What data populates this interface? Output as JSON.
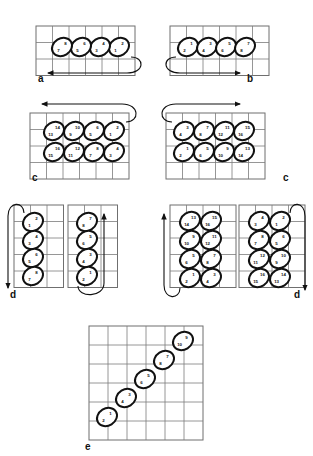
{
  "figure": {
    "panels": [
      {
        "id": "a",
        "label": "a",
        "label_x": 38,
        "label_y": 82,
        "grid": {
          "x": 36,
          "y": 26,
          "cols": 6,
          "rows": 3,
          "cell": 16.5
        },
        "direction": "right-to-left",
        "cells": [
          {
            "cx": 119,
            "cy": 47,
            "top": "2",
            "bottom": "1"
          },
          {
            "cx": 100,
            "cy": 47,
            "top": "4",
            "bottom": "3"
          },
          {
            "cx": 81,
            "cy": 47,
            "top": "6",
            "bottom": "5"
          },
          {
            "cx": 62,
            "cy": 47,
            "top": "8",
            "bottom": "7"
          }
        ],
        "arrow": {
          "type": "u-turn-left",
          "x1": 131,
          "y1": 57,
          "x2": 48,
          "y2": 73
        }
      },
      {
        "id": "b",
        "label": "b",
        "label_x": 247,
        "label_y": 82,
        "grid": {
          "x": 170,
          "y": 26,
          "cols": 6,
          "rows": 3,
          "cell": 16.5
        },
        "direction": "left-to-right",
        "cells": [
          {
            "cx": 188,
            "cy": 47,
            "top": "1",
            "bottom": "2"
          },
          {
            "cx": 207,
            "cy": 47,
            "top": "3",
            "bottom": "4"
          },
          {
            "cx": 226,
            "cy": 47,
            "top": "5",
            "bottom": "6"
          },
          {
            "cx": 245,
            "cy": 47,
            "top": "7",
            "bottom": "8"
          }
        ],
        "arrow": {
          "type": "u-turn-right",
          "x1": 176,
          "y1": 57,
          "x2": 240,
          "y2": 73
        }
      },
      {
        "id": "c-left",
        "label": "c",
        "label_x": 32,
        "label_y": 181,
        "grid": {
          "x": 30,
          "y": 113,
          "cols": 6,
          "rows": 4,
          "cell": 16.5
        },
        "direction": "right-to-left-boustrophedon",
        "cells": [
          {
            "cx": 114,
            "cy": 131,
            "top": "2",
            "bottom": "1"
          },
          {
            "cx": 94,
            "cy": 131,
            "top": "6",
            "bottom": "5"
          },
          {
            "cx": 74,
            "cy": 131,
            "top": "10",
            "bottom": "9"
          },
          {
            "cx": 54,
            "cy": 131,
            "top": "14",
            "bottom": "13"
          },
          {
            "cx": 114,
            "cy": 152,
            "top": "4",
            "bottom": "3"
          },
          {
            "cx": 94,
            "cy": 152,
            "top": "8",
            "bottom": "7"
          },
          {
            "cx": 74,
            "cy": 152,
            "top": "12",
            "bottom": "11"
          },
          {
            "cx": 54,
            "cy": 152,
            "top": "16",
            "bottom": "15"
          }
        ],
        "arrow": {
          "type": "u-turn-left",
          "x1": 126,
          "y1": 122,
          "x2": 42,
          "y2": 104
        }
      },
      {
        "id": "c-right",
        "label": "c",
        "label_x": 283,
        "label_y": 181,
        "grid": {
          "x": 166,
          "y": 113,
          "cols": 6,
          "rows": 4,
          "cell": 16.5
        },
        "direction": "left-to-right-boustrophedon",
        "cells": [
          {
            "cx": 184,
            "cy": 131,
            "top": "3",
            "bottom": "4"
          },
          {
            "cx": 204,
            "cy": 131,
            "top": "7",
            "bottom": "8"
          },
          {
            "cx": 224,
            "cy": 131,
            "top": "11",
            "bottom": "12"
          },
          {
            "cx": 244,
            "cy": 131,
            "top": "15",
            "bottom": "16"
          },
          {
            "cx": 184,
            "cy": 152,
            "top": "1",
            "bottom": "2"
          },
          {
            "cx": 204,
            "cy": 152,
            "top": "5",
            "bottom": "6"
          },
          {
            "cx": 224,
            "cy": 152,
            "top": "9",
            "bottom": "10"
          },
          {
            "cx": 244,
            "cy": 152,
            "top": "13",
            "bottom": "14"
          }
        ],
        "arrow": {
          "type": "u-turn-right",
          "x1": 172,
          "y1": 122,
          "x2": 240,
          "y2": 104
        }
      },
      {
        "id": "d-1",
        "label": "d",
        "label_x": 10,
        "label_y": 298,
        "grid": {
          "x": 14,
          "y": 205,
          "cols": 3,
          "rows": 5,
          "cell": 16.5
        },
        "direction": "top-to-bottom",
        "cells": [
          {
            "cx": 33,
            "cy": 222,
            "top": "2",
            "bottom": "1"
          },
          {
            "cx": 33,
            "cy": 240,
            "top": "4",
            "bottom": "3"
          },
          {
            "cx": 33,
            "cy": 258,
            "top": "6",
            "bottom": "5"
          },
          {
            "cx": 33,
            "cy": 276,
            "top": "8",
            "bottom": "7"
          }
        ],
        "arrow": {
          "type": "u-turn-down",
          "x1": 24,
          "y1": 213,
          "x2": 8,
          "y2": 288
        }
      },
      {
        "id": "d-2",
        "label": "",
        "label_x": 0,
        "label_y": 0,
        "grid": {
          "x": 68,
          "y": 205,
          "cols": 3,
          "rows": 5,
          "cell": 16.5
        },
        "direction": "bottom-to-top",
        "cells": [
          {
            "cx": 87,
            "cy": 222,
            "top": "7",
            "bottom": "8"
          },
          {
            "cx": 87,
            "cy": 240,
            "top": "5",
            "bottom": "6"
          },
          {
            "cx": 87,
            "cy": 258,
            "top": "3",
            "bottom": "4"
          },
          {
            "cx": 87,
            "cy": 276,
            "top": "1",
            "bottom": "2"
          }
        ],
        "arrow": {
          "type": "u-turn-up",
          "x1": 78,
          "y1": 286,
          "x2": 104,
          "y2": 214
        }
      },
      {
        "id": "d-3",
        "label": "",
        "label_x": 0,
        "label_y": 0,
        "grid": {
          "x": 170,
          "y": 205,
          "cols": 4,
          "rows": 5,
          "cell": 16.5
        },
        "direction": "bottom-to-top-boustrophedon",
        "cells": [
          {
            "cx": 190,
            "cy": 221,
            "top": "13",
            "bottom": "14"
          },
          {
            "cx": 211,
            "cy": 221,
            "top": "15",
            "bottom": "16"
          },
          {
            "cx": 190,
            "cy": 240,
            "top": "9",
            "bottom": "10"
          },
          {
            "cx": 211,
            "cy": 240,
            "top": "11",
            "bottom": "12"
          },
          {
            "cx": 190,
            "cy": 259,
            "top": "5",
            "bottom": "6"
          },
          {
            "cx": 211,
            "cy": 259,
            "top": "7",
            "bottom": "8"
          },
          {
            "cx": 190,
            "cy": 278,
            "top": "1",
            "bottom": "2"
          },
          {
            "cx": 211,
            "cy": 278,
            "top": "3",
            "bottom": "4"
          }
        ],
        "arrow": {
          "type": "u-turn-up",
          "x1": 180,
          "y1": 288,
          "x2": 164,
          "y2": 214
        }
      },
      {
        "id": "d-4",
        "label": "d",
        "label_x": 294,
        "label_y": 298,
        "grid": {
          "x": 239,
          "y": 205,
          "cols": 4,
          "rows": 5,
          "cell": 16.5
        },
        "direction": "top-to-bottom-boustrophedon",
        "cells": [
          {
            "cx": 259,
            "cy": 221,
            "top": "4",
            "bottom": "3"
          },
          {
            "cx": 280,
            "cy": 221,
            "top": "2",
            "bottom": "1"
          },
          {
            "cx": 259,
            "cy": 240,
            "top": "8",
            "bottom": "7"
          },
          {
            "cx": 280,
            "cy": 240,
            "top": "6",
            "bottom": "5"
          },
          {
            "cx": 259,
            "cy": 259,
            "top": "12",
            "bottom": "11"
          },
          {
            "cx": 280,
            "cy": 259,
            "top": "10",
            "bottom": "9"
          },
          {
            "cx": 259,
            "cy": 278,
            "top": "16",
            "bottom": "15"
          },
          {
            "cx": 280,
            "cy": 278,
            "top": "14",
            "bottom": "13"
          }
        ],
        "arrow": {
          "type": "u-turn-down",
          "x1": 290,
          "y1": 213,
          "x2": 305,
          "y2": 290
        }
      },
      {
        "id": "e",
        "label": "e",
        "label_x": 85,
        "label_y": 450,
        "grid": {
          "x": 89,
          "y": 326,
          "cols": 6,
          "rows": 6,
          "cell": 19
        },
        "direction": "diagonal",
        "cells": [
          {
            "cx": 107,
            "cy": 417,
            "top": "1",
            "bottom": "2"
          },
          {
            "cx": 126,
            "cy": 398,
            "top": "3",
            "bottom": "4"
          },
          {
            "cx": 145,
            "cy": 379,
            "top": "5",
            "bottom": "6"
          },
          {
            "cx": 164,
            "cy": 360,
            "top": "7",
            "bottom": "8"
          },
          {
            "cx": 183,
            "cy": 341,
            "top": "9",
            "bottom": "10"
          }
        ],
        "arrow": null
      }
    ]
  }
}
